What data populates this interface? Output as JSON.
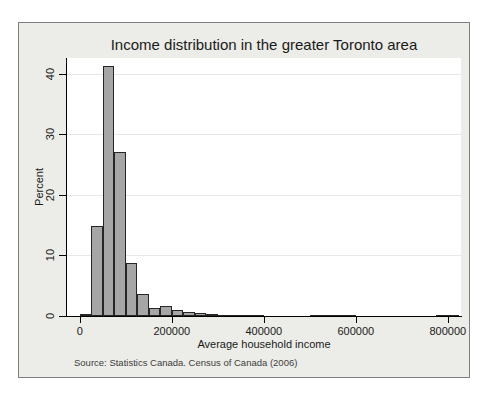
{
  "chart_data": {
    "type": "bar",
    "subtype": "histogram",
    "title": "Income distribution in the greater Toronto area",
    "xlabel": "Average household income",
    "ylabel": "Percent",
    "note": "Source: Statistics Canada. Census of Canada (2006)",
    "bin_width": 25000,
    "bin_starts": [
      0,
      25000,
      50000,
      75000,
      100000,
      125000,
      150000,
      175000,
      200000,
      225000,
      250000,
      275000,
      300000,
      325000,
      350000,
      375000,
      400000,
      425000,
      450000,
      475000,
      500000,
      525000,
      550000,
      575000,
      600000,
      625000,
      650000,
      675000,
      700000,
      725000,
      750000,
      775000,
      800000
    ],
    "percents": [
      0.4,
      14.8,
      41.3,
      27.1,
      8.7,
      3.6,
      1.3,
      1.7,
      1.0,
      0.7,
      0.45,
      0.3,
      0.25,
      0.25,
      0.2,
      0.1,
      0,
      0,
      0,
      0,
      0.15,
      0.15,
      0.1,
      0.15,
      0,
      0,
      0,
      0,
      0,
      0,
      0,
      0.15,
      0.1
    ],
    "x_ticks": [
      {
        "v": 0,
        "label": "0"
      },
      {
        "v": 200000,
        "label": "200000"
      },
      {
        "v": 400000,
        "label": "400000"
      },
      {
        "v": 600000,
        "label": "600000"
      },
      {
        "v": 800000,
        "label": "800000"
      }
    ],
    "y_ticks": [
      {
        "v": 0,
        "label": "0"
      },
      {
        "v": 10,
        "label": "10"
      },
      {
        "v": 20,
        "label": "20"
      },
      {
        "v": 30,
        "label": "30"
      },
      {
        "v": 40,
        "label": "40"
      }
    ],
    "x_domain": [
      -28000,
      828600
    ],
    "y_domain": [
      0,
      42.6
    ],
    "grid": "horizontal-only",
    "legend": "none",
    "colors": {
      "outer_background": "#ECECE8",
      "plot_background": "#FFFFFF",
      "bar_fill": "#A6A6A6",
      "bar_border": "#262626",
      "gridline": "#E3EAE7",
      "axis": "#000000",
      "frame_border": "#7F7F7F",
      "text": "#1A1A1A"
    }
  }
}
